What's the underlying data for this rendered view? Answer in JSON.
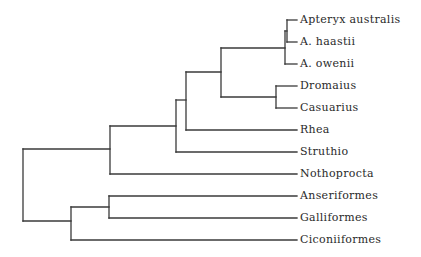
{
  "diagram": {
    "type": "phylogenetic-tree",
    "line_color": "#3a3a3a",
    "taxa": [
      {
        "id": "apteryx_australis",
        "label": "Apteryx australis",
        "y": 20
      },
      {
        "id": "a_haastii",
        "label": "A. haastii",
        "y": 42
      },
      {
        "id": "a_owenii",
        "label": "A. owenii",
        "y": 64
      },
      {
        "id": "dromaius",
        "label": "Dromaius",
        "y": 86
      },
      {
        "id": "casuarius",
        "label": "Casuarius",
        "y": 108
      },
      {
        "id": "rhea",
        "label": "Rhea",
        "y": 130
      },
      {
        "id": "struthio",
        "label": "Struthio",
        "y": 152
      },
      {
        "id": "nothoprocta",
        "label": "Nothoprocta",
        "y": 174
      },
      {
        "id": "anseriformes",
        "label": "Anseriformes",
        "y": 196
      },
      {
        "id": "galliformes",
        "label": "Galliformes",
        "y": 218
      },
      {
        "id": "ciconiiformes",
        "label": "Ciconiiformes",
        "y": 240
      }
    ],
    "newick": "((((((Apteryx australis,A. haastii),A. owenii),(Dromaius,Casuarius)),Rhea),Struthio),Nothoprocta),((Anseriformes,Galliformes),Ciconiiformes));"
  }
}
